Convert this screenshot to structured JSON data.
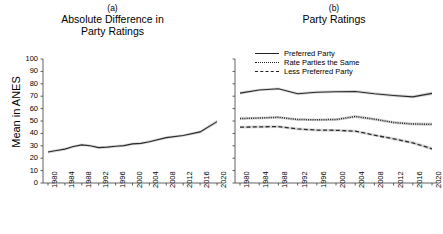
{
  "figure": {
    "y_axis_label": "Mean in ANES",
    "y_ticks": [
      0,
      10,
      20,
      30,
      40,
      50,
      60,
      70,
      80,
      90,
      100
    ],
    "x_ticks": [
      "1980",
      "1984",
      "1988",
      "1992",
      "1996",
      "2000",
      "2004",
      "2008",
      "2012",
      "2016",
      "2020"
    ]
  },
  "panel_a": {
    "label": "(a)",
    "title_line1": "Absolute Difference in",
    "title_line2": "Party Ratings"
  },
  "panel_b": {
    "label": "(b)",
    "title_line1": "Party Ratings",
    "title_line2": "",
    "legend": [
      {
        "name": "preferred-party",
        "label": "Preferred Party",
        "style": "solid"
      },
      {
        "name": "rate-parties-the-same",
        "label": "Rate Parties the Same",
        "style": "dotted"
      },
      {
        "name": "less-preferred-party",
        "label": "Less Preferred Party",
        "style": "dashed"
      }
    ]
  },
  "chart_data": [
    {
      "type": "line",
      "panel": "(a)",
      "title": "Absolute Difference in Party Ratings",
      "xlabel": "",
      "ylabel": "Mean in ANES",
      "ylim": [
        0,
        100
      ],
      "grid": false,
      "legend_position": "none",
      "x": [
        "1980",
        "1982",
        "1984",
        "1986",
        "1988",
        "1990",
        "1992",
        "1994",
        "1996",
        "1998",
        "2000",
        "2002",
        "2004",
        "2008",
        "2012",
        "2016",
        "2020"
      ],
      "series": [
        {
          "name": "Absolute Difference",
          "style": "solid",
          "values": [
            25.0,
            26.2,
            27.3,
            29.4,
            30.7,
            30.0,
            28.5,
            28.9,
            29.6,
            30.1,
            31.5,
            32.0,
            33.3,
            36.6,
            38.3,
            41.2,
            49.5
          ],
          "ci_low": [
            23.8,
            25.1,
            26.2,
            28.3,
            29.6,
            28.9,
            27.4,
            27.8,
            28.5,
            29.0,
            30.4,
            30.9,
            32.2,
            35.5,
            37.2,
            40.0,
            48.0
          ],
          "ci_high": [
            26.2,
            27.3,
            28.4,
            30.5,
            31.8,
            31.1,
            29.6,
            30.0,
            30.7,
            31.2,
            32.6,
            33.1,
            34.4,
            37.7,
            39.4,
            42.4,
            51.0
          ]
        }
      ]
    },
    {
      "type": "line",
      "panel": "(b)",
      "title": "Party Ratings",
      "xlabel": "",
      "ylabel": "Mean in ANES",
      "ylim": [
        0,
        100
      ],
      "grid": false,
      "legend_position": "upper-left",
      "x": [
        "1980",
        "1984",
        "1988",
        "1992",
        "1996",
        "2000",
        "2004",
        "2008",
        "2012",
        "2016",
        "2020"
      ],
      "series": [
        {
          "name": "Preferred Party",
          "style": "solid",
          "values": [
            72.5,
            75.0,
            76.0,
            72.0,
            73.2,
            73.6,
            73.8,
            72.0,
            70.6,
            69.5,
            72.3
          ],
          "ci_low": [
            71.3,
            73.9,
            74.9,
            70.8,
            72.1,
            72.5,
            72.7,
            70.9,
            69.4,
            68.3,
            70.8
          ],
          "ci_high": [
            73.7,
            76.1,
            77.1,
            73.2,
            74.3,
            74.7,
            74.9,
            73.1,
            71.8,
            70.7,
            73.8
          ]
        },
        {
          "name": "Rate Parties the Same",
          "style": "dotted",
          "values": [
            52.0,
            52.4,
            53.0,
            51.2,
            51.0,
            51.2,
            53.6,
            51.5,
            48.8,
            47.6,
            47.3
          ],
          "ci_low": [
            50.9,
            51.3,
            51.9,
            50.1,
            49.9,
            50.1,
            52.4,
            50.3,
            47.6,
            46.4,
            45.9
          ],
          "ci_high": [
            53.1,
            53.5,
            54.1,
            52.3,
            52.1,
            52.3,
            54.8,
            52.7,
            50.0,
            48.8,
            48.7
          ]
        },
        {
          "name": "Less Preferred Party",
          "style": "dashed",
          "values": [
            45.0,
            45.3,
            45.5,
            43.6,
            42.7,
            42.5,
            41.8,
            38.6,
            35.6,
            32.4,
            27.6
          ],
          "ci_low": [
            43.9,
            44.2,
            44.4,
            42.5,
            41.6,
            41.4,
            40.7,
            37.5,
            34.4,
            31.2,
            26.2
          ],
          "ci_high": [
            46.1,
            46.4,
            46.6,
            44.7,
            43.8,
            43.6,
            42.9,
            39.7,
            36.8,
            33.6,
            29.0
          ]
        }
      ]
    }
  ]
}
